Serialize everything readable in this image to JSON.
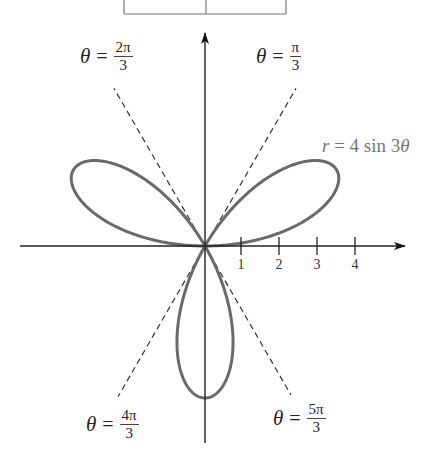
{
  "chart_data": {
    "type": "polar",
    "title": "",
    "equation": "r = 4 sin 3θ",
    "equation_parts": {
      "r": "r",
      "eq": " = 4 sin 3",
      "theta": "θ"
    },
    "amplitude": 4,
    "k": 3,
    "theta_range": [
      0,
      3.14159265
    ],
    "x_ticks": [
      1,
      2,
      3,
      4
    ],
    "x_tick_labels": [
      "1",
      "2",
      "3",
      "4"
    ],
    "xlim": [
      -5,
      5
    ],
    "ylim": [
      -5.3,
      5.7
    ],
    "dashed_lines": [
      {
        "angle_label_num": "π",
        "angle_label_den": "3",
        "angle_rad": 1.0472
      },
      {
        "angle_label_num": "2π",
        "angle_label_den": "3",
        "angle_rad": 2.0944
      },
      {
        "angle_label_num": "4π",
        "angle_label_den": "3",
        "angle_rad": 4.1888
      },
      {
        "angle_label_num": "5π",
        "angle_label_den": "3",
        "angle_rad": 5.236
      }
    ],
    "petals": [
      {
        "tip_angle_deg": 30,
        "tip_r": 4
      },
      {
        "tip_angle_deg": 150,
        "tip_r": 4
      },
      {
        "tip_angle_deg": 270,
        "tip_r": 4
      }
    ]
  },
  "labels": {
    "theta_symbol": "θ",
    "equals": "=",
    "line_pi_3": {
      "num": "π",
      "den": "3"
    },
    "line_2pi_3": {
      "num": "2π",
      "den": "3"
    },
    "line_4pi_3": {
      "num": "4π",
      "den": "3"
    },
    "line_5pi_3": {
      "num": "5π",
      "den": "3"
    }
  },
  "colors": {
    "curve": "#6a6a6a",
    "axes": "#222222",
    "dashed": "#333333",
    "curve_label": "#777777"
  }
}
